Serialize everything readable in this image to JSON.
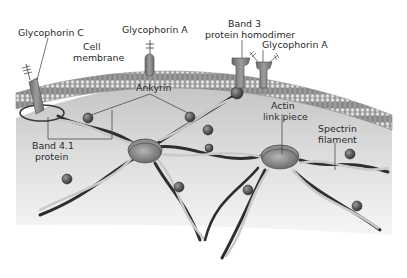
{
  "diagram": {
    "labels": {
      "glycophorin_c": "Glycophorin C",
      "cell_membrane_1": "Cell",
      "cell_membrane_2": "membrane",
      "glycophorin_a_left": "Glycophorin A",
      "band3_1": "Band 3",
      "band3_2": "protein homodimer",
      "glycophorin_a_right": "Glycophorin A",
      "ankyrin": "Ankyrin",
      "actin_1": "Actin",
      "actin_2": "link piece",
      "spectrin_1": "Spectrin",
      "spectrin_2": "filament",
      "band41_1": "Band 4.1",
      "band41_2": "protein"
    },
    "colors": {
      "background": "#ffffff",
      "cytoplasm": "#d9d9d9",
      "membrane_head": "#b8b8b8",
      "membrane_tail": "#8f8f8f",
      "protein": "#7d7d7d",
      "spectrin_dark": "#2e2e2e",
      "spectrin_light": "#c9c9c9",
      "label_text": "#2a2a2a",
      "leader_line": "#3a3a3a"
    }
  }
}
